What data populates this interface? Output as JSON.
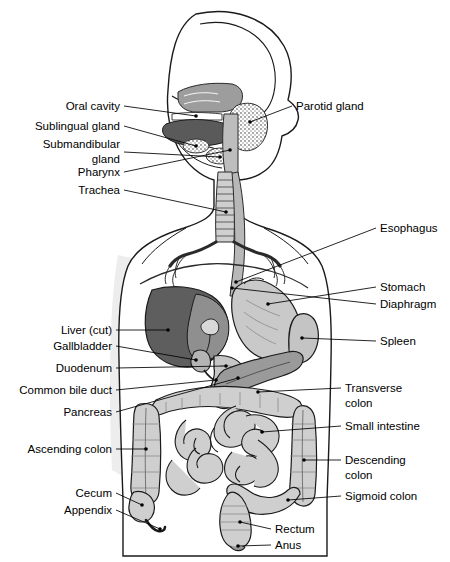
{
  "figure": {
    "type": "labeled-anatomical-illustration",
    "background_color": "#ffffff",
    "line_color": "#000000",
    "label_font_size_px": 11.5
  },
  "palette": {
    "body_outline": "#1a1a1a",
    "body_fill": "#ffffff",
    "body_shadow": "#e8e8e8",
    "liver_dark": "#5e5e5e",
    "liver_mid": "#8f8f8f",
    "stomach": "#c9c9c9",
    "spleen": "#c4c4c4",
    "pancreas": "#9a9a9a",
    "intestine": "#cfcfcf",
    "intestine_dark": "#b0b0b0",
    "tongue": "#6a6a6a",
    "nasal": "#9d9d9d",
    "gland_stipple": "#d8d8d8",
    "trachea": "#cccccc",
    "esophagus": "#b8b8b8"
  },
  "labels_left": [
    {
      "id": "oral-cavity",
      "text": "Oral cavity",
      "x": 120,
      "y": 110,
      "lines": [
        "Oral cavity"
      ]
    },
    {
      "id": "sublingual-gland",
      "text": "Sublingual gland",
      "x": 120,
      "y": 130,
      "lines": [
        "Sublingual gland"
      ]
    },
    {
      "id": "submandibular-gland",
      "text": "Submandibular gland",
      "x": 120,
      "y": 148,
      "lines": [
        "Submandibular",
        "gland"
      ]
    },
    {
      "id": "pharynx",
      "text": "Pharynx",
      "x": 120,
      "y": 176,
      "lines": [
        "Pharynx"
      ]
    },
    {
      "id": "trachea",
      "text": "Trachea",
      "x": 120,
      "y": 194,
      "lines": [
        "Trachea"
      ]
    },
    {
      "id": "liver-cut",
      "text": "Liver (cut)",
      "x": 112,
      "y": 334,
      "lines": [
        "Liver (cut)"
      ]
    },
    {
      "id": "gallbladder",
      "text": "Gallbladder",
      "x": 112,
      "y": 350,
      "lines": [
        "Gallbladder"
      ]
    },
    {
      "id": "duodenum",
      "text": "Duodenum",
      "x": 112,
      "y": 372,
      "lines": [
        "Duodenum"
      ]
    },
    {
      "id": "common-bile-duct",
      "text": "Common bile duct",
      "x": 112,
      "y": 394,
      "lines": [
        "Common bile duct"
      ]
    },
    {
      "id": "pancreas",
      "text": "Pancreas",
      "x": 112,
      "y": 416,
      "lines": [
        "Pancreas"
      ]
    },
    {
      "id": "ascending-colon",
      "text": "Ascending colon",
      "x": 112,
      "y": 453,
      "lines": [
        "Ascending colon"
      ]
    },
    {
      "id": "cecum",
      "text": "Cecum",
      "x": 112,
      "y": 497,
      "lines": [
        "Cecum"
      ]
    },
    {
      "id": "appendix",
      "text": "Appendix",
      "x": 112,
      "y": 514,
      "lines": [
        "Appendix"
      ]
    }
  ],
  "labels_right": [
    {
      "id": "parotid-gland",
      "text": "Parotid gland",
      "x": 296,
      "y": 110,
      "lines": [
        "Parotid gland"
      ]
    },
    {
      "id": "esophagus",
      "text": "Esophagus",
      "x": 380,
      "y": 232,
      "lines": [
        "Esophagus"
      ]
    },
    {
      "id": "stomach",
      "text": "Stomach",
      "x": 380,
      "y": 291,
      "lines": [
        "Stomach"
      ]
    },
    {
      "id": "diaphragm",
      "text": "Diaphragm",
      "x": 380,
      "y": 308,
      "lines": [
        "Diaphragm"
      ]
    },
    {
      "id": "spleen",
      "text": "Spleen",
      "x": 380,
      "y": 345,
      "lines": [
        "Spleen"
      ]
    },
    {
      "id": "transverse-colon",
      "text": "Transverse colon",
      "x": 345,
      "y": 392,
      "lines": [
        "Transverse",
        "colon"
      ]
    },
    {
      "id": "small-intestine",
      "text": "Small intestine",
      "x": 345,
      "y": 430,
      "lines": [
        "Small intestine"
      ]
    },
    {
      "id": "descending-colon",
      "text": "Descending colon",
      "x": 345,
      "y": 464,
      "lines": [
        "Descending",
        "colon"
      ]
    },
    {
      "id": "sigmoid-colon",
      "text": "Sigmoid colon",
      "x": 345,
      "y": 500,
      "lines": [
        "Sigmoid colon"
      ]
    },
    {
      "id": "rectum",
      "text": "Rectum",
      "x": 275,
      "y": 533,
      "lines": [
        "Rectum"
      ]
    },
    {
      "id": "anus",
      "text": "Anus",
      "x": 275,
      "y": 549,
      "lines": [
        "Anus"
      ]
    }
  ],
  "organs": [
    {
      "id": "skull",
      "name": "skull-profile"
    },
    {
      "id": "nasal-cavity",
      "name": "nasal-cavity"
    },
    {
      "id": "tongue",
      "name": "tongue"
    },
    {
      "id": "oral-cavity-organ",
      "name": "oral-cavity"
    },
    {
      "id": "sublingual",
      "name": "sublingual-gland"
    },
    {
      "id": "submandibular",
      "name": "submandibular-gland"
    },
    {
      "id": "parotid",
      "name": "parotid-gland"
    },
    {
      "id": "pharynx-organ",
      "name": "pharynx"
    },
    {
      "id": "trachea-organ",
      "name": "trachea"
    },
    {
      "id": "bronchi",
      "name": "bronchi"
    },
    {
      "id": "esophagus-organ",
      "name": "esophagus"
    },
    {
      "id": "diaphragm-organ",
      "name": "diaphragm"
    },
    {
      "id": "liver-organ",
      "name": "liver"
    },
    {
      "id": "gallbladder-organ",
      "name": "gallbladder"
    },
    {
      "id": "stomach-organ",
      "name": "stomach"
    },
    {
      "id": "spleen-organ",
      "name": "spleen"
    },
    {
      "id": "pancreas-organ",
      "name": "pancreas"
    },
    {
      "id": "duodenum-organ",
      "name": "duodenum"
    },
    {
      "id": "small-intestine-organ",
      "name": "small-intestine"
    },
    {
      "id": "ascending-colon-organ",
      "name": "ascending-colon"
    },
    {
      "id": "transverse-colon-organ",
      "name": "transverse-colon"
    },
    {
      "id": "descending-colon-organ",
      "name": "descending-colon"
    },
    {
      "id": "sigmoid-colon-organ",
      "name": "sigmoid-colon"
    },
    {
      "id": "cecum-organ",
      "name": "cecum"
    },
    {
      "id": "appendix-organ",
      "name": "appendix"
    },
    {
      "id": "rectum-organ",
      "name": "rectum"
    },
    {
      "id": "anus-organ",
      "name": "anus"
    }
  ]
}
